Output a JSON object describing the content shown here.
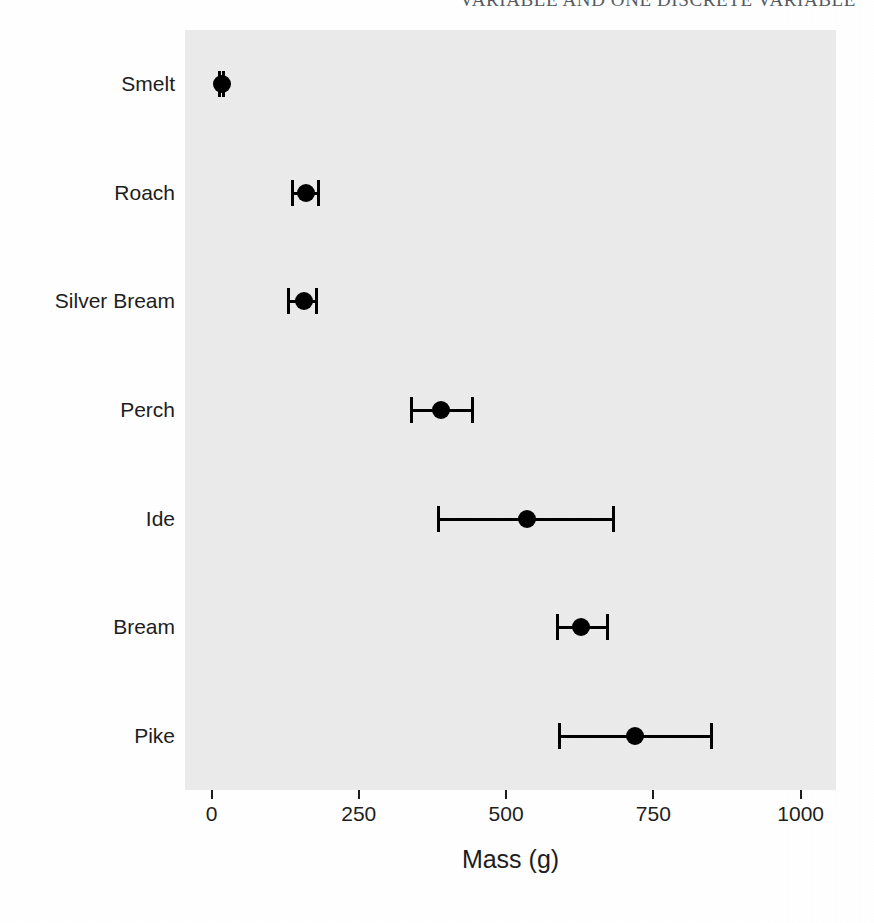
{
  "page": {
    "running_header": "VARIABLE AND ONE DISCRETE VARIABLE"
  },
  "chart_data": {
    "type": "scatter",
    "subtype": "dot-plot-with-error-bars",
    "title": "",
    "xlabel": "Mass (g)",
    "ylabel": "",
    "xlim": [
      -45,
      1060
    ],
    "xticks": [
      0,
      250,
      500,
      750,
      1000
    ],
    "xtick_labels": [
      "0",
      "250",
      "500",
      "750",
      "1000"
    ],
    "categories": [
      "Smelt",
      "Roach",
      "Silver Bream",
      "Perch",
      "Ide",
      "Bream",
      "Pike"
    ],
    "grid": false,
    "legend": false,
    "panel_background": "#ebebeb",
    "marker_color": "#000000",
    "points": [
      {
        "category": "Smelt",
        "value": 17,
        "low": 13,
        "high": 21
      },
      {
        "category": "Roach",
        "value": 160,
        "low": 137,
        "high": 182
      },
      {
        "category": "Silver Bream",
        "value": 157,
        "low": 131,
        "high": 178
      },
      {
        "category": "Perch",
        "value": 390,
        "low": 340,
        "high": 443
      },
      {
        "category": "Ide",
        "value": 536,
        "low": 385,
        "high": 682
      },
      {
        "category": "Bream",
        "value": 627,
        "low": 587,
        "high": 672
      },
      {
        "category": "Pike",
        "value": 719,
        "low": 591,
        "high": 848
      }
    ]
  }
}
